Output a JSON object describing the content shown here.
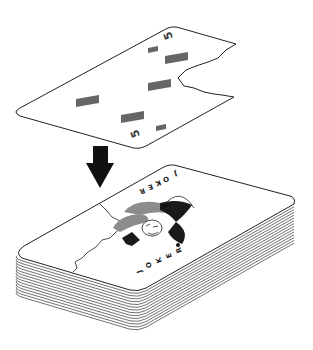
{
  "illustration": {
    "description": "A five of diamonds card being placed onto a deck of cards topped by a joker",
    "top_card": {
      "rank": "5",
      "suit": "diamonds",
      "corner_labels": [
        "5",
        "5"
      ],
      "pip_count": 5,
      "pip_color": "#666666"
    },
    "arrow": {
      "direction": "down",
      "color": "#111111"
    },
    "deck": {
      "top_card": "joker",
      "joker_text_top": "JOKER",
      "joker_text_bottom": "JOKER",
      "stack_lines": 14,
      "accent_gray": "#8c8c8c"
    }
  }
}
